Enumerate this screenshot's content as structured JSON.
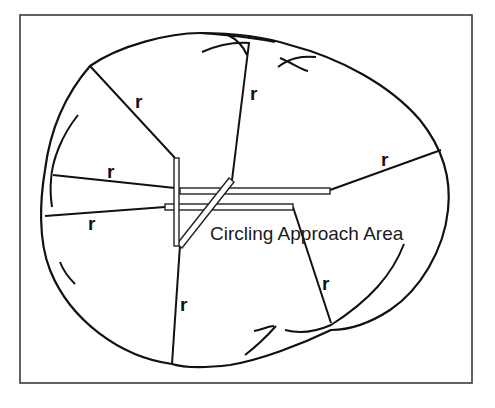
{
  "diagram": {
    "title_label": "Circling Approach Area",
    "radius_label": "r",
    "radius_labels": [
      "r",
      "r",
      "r",
      "r",
      "r",
      "r",
      "r"
    ],
    "colors": {
      "line": "#111111",
      "frame": "#3a3a3a",
      "background": "#ffffff"
    },
    "elements": {
      "runways": [
        "vertical-runway",
        "horizontal-runway-upper",
        "horizontal-runway-lower",
        "diagonal-runway"
      ],
      "radius_count": 7
    }
  }
}
